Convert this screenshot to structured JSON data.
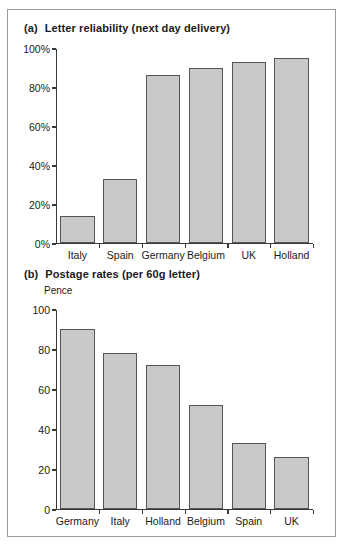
{
  "figure": {
    "panels": [
      {
        "tag": "(a)",
        "title": "Letter reliability (next day delivery)",
        "unit_label": ""
      },
      {
        "tag": "(b)",
        "title": "Postage rates (per 60g letter)",
        "unit_label": "Pence"
      }
    ],
    "colors": {
      "bar_fill": "#c9c9c9",
      "bar_edge": "#555555",
      "axis": "#3a3a3a",
      "frame": "#9a9a9a",
      "background": "#ffffff",
      "text": "#1a1a1a"
    }
  },
  "chart_data": [
    {
      "type": "bar",
      "title": "(a) Letter reliability (next day delivery)",
      "xlabel": "",
      "ylabel": "",
      "categories": [
        "Italy",
        "Spain",
        "Germany",
        "Belgium",
        "UK",
        "Holland"
      ],
      "values": [
        14,
        33,
        86,
        90,
        93,
        95
      ],
      "ytick_labels": [
        "0%",
        "20%",
        "40%",
        "60%",
        "80%",
        "100%"
      ],
      "ytick_values": [
        0,
        20,
        40,
        60,
        80,
        100
      ],
      "ylim": [
        0,
        100
      ],
      "grid": false,
      "legend": null
    },
    {
      "type": "bar",
      "title": "(b) Postage rates (per 60g letter)",
      "xlabel": "",
      "ylabel": "Pence",
      "categories": [
        "Germany",
        "Italy",
        "Holland",
        "Belgium",
        "Spain",
        "UK"
      ],
      "values": [
        90,
        78,
        72,
        52,
        33,
        26
      ],
      "ytick_labels": [
        "0",
        "20",
        "40",
        "60",
        "80",
        "100"
      ],
      "ytick_values": [
        0,
        20,
        40,
        60,
        80,
        100
      ],
      "ylim": [
        0,
        100
      ],
      "grid": false,
      "legend": null
    }
  ]
}
